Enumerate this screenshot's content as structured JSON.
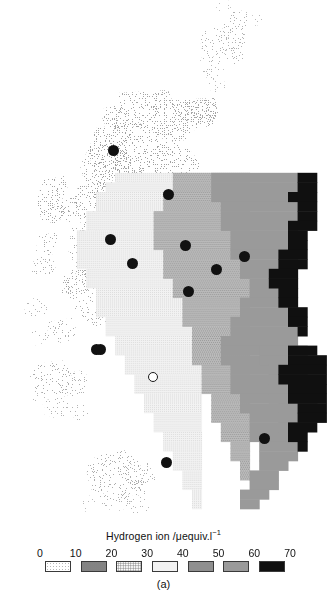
{
  "figure": {
    "caption": "(a)",
    "legend": {
      "title_main": "Hydrogen ion /μequiv.l",
      "title_exponent": "−1",
      "tick_labels": [
        "0",
        "10",
        "20",
        "30",
        "40",
        "50",
        "60",
        "70"
      ],
      "classes": [
        {
          "range": "0–10",
          "fill": "#ffffff",
          "pattern": "sparse-dots-1",
          "dot_color": "#b8b8b8"
        },
        {
          "range": "10–20",
          "fill": "#ffffff",
          "pattern": "dots-2",
          "dot_color": "#7a7a7a"
        },
        {
          "range": "20–30",
          "fill": "#ffffff",
          "pattern": "dots-3",
          "dot_color": "#8a8a8a"
        },
        {
          "range": "30–40",
          "fill": "#f2f2f2",
          "pattern": "fine-dots-4",
          "dot_color": "#c8c8c8"
        },
        {
          "range": "40–50",
          "fill": "#b9b9b9",
          "pattern": "checker-5",
          "dot_color": "#8f8f8f"
        },
        {
          "range": "50–60",
          "fill": "#9a9a9a",
          "pattern": "solid",
          "dot_color": "#9a9a9a"
        },
        {
          "range": "60–70",
          "fill": "#101010",
          "pattern": "solid",
          "dot_color": "#101010"
        }
      ]
    }
  },
  "chart_data": {
    "type": "map",
    "title": "Hydrogen ion /μequiv.l−1",
    "subtitle": "(a)",
    "variable": "Hydrogen ion concentration",
    "unit": "μequiv.l−1",
    "region": "Scotland",
    "projection_note": "gridded choropleth, cells approx. 10 x 10 px",
    "class_breaks": [
      0,
      10,
      20,
      30,
      40,
      50,
      60,
      70
    ],
    "class_labels": [
      "0–10",
      "10–20",
      "20–30",
      "30–40",
      "40–50",
      "50–60",
      "60–70"
    ],
    "class_colors": [
      "#ffffff",
      "#ffffff",
      "#ffffff",
      "#f2f2f2",
      "#b9b9b9",
      "#9a9a9a",
      "#101010"
    ],
    "legend_position": "bottom",
    "grid": false,
    "spatial_gradient": "values increase from west (low, 0–20) to east/southeast (high, 60–70)",
    "markers": {
      "filled_label": "sampling site",
      "open_label": "reference site",
      "filled_count": 12,
      "open_count": 1,
      "filled_points": [
        {
          "x": 113,
          "y": 150
        },
        {
          "x": 110,
          "y": 239
        },
        {
          "x": 168,
          "y": 194
        },
        {
          "x": 132,
          "y": 263
        },
        {
          "x": 185,
          "y": 245
        },
        {
          "x": 216,
          "y": 269
        },
        {
          "x": 244,
          "y": 256
        },
        {
          "x": 188,
          "y": 291
        },
        {
          "x": 100,
          "y": 349
        },
        {
          "x": 96,
          "y": 349
        },
        {
          "x": 166,
          "y": 462
        },
        {
          "x": 264,
          "y": 438
        }
      ],
      "open_points": [
        {
          "x": 153,
          "y": 377
        }
      ]
    }
  }
}
